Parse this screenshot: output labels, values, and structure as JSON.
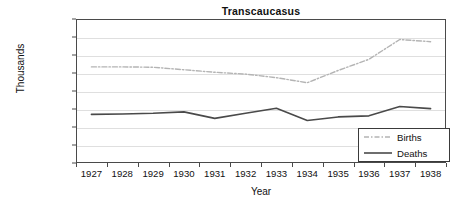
{
  "chart_data": {
    "type": "line",
    "title": "Transcaucasus",
    "xlabel": "Year",
    "ylabel": "Thousands",
    "categories": [
      "1927",
      "1928",
      "1929",
      "1930",
      "1931",
      "1932",
      "1933",
      "1934",
      "1935",
      "1936",
      "1937",
      "1938"
    ],
    "x": [
      1927,
      1928,
      1929,
      1930,
      1931,
      1932,
      1933,
      1934,
      1935,
      1936,
      1937,
      1938
    ],
    "series": [
      {
        "name": "Births",
        "values": [
          267,
          267,
          266,
          259,
          252,
          247,
          237,
          223,
          257,
          288,
          343,
          337
        ],
        "color": "#b4b4b4",
        "style": "dash-dot"
      },
      {
        "name": "Deaths",
        "values": [
          135,
          136,
          138,
          142,
          124,
          138,
          152,
          118,
          128,
          131,
          157,
          151
        ],
        "color": "#4a4a4a",
        "style": "solid"
      }
    ],
    "ylim": [
      0,
      400
    ],
    "yticks": [
      0,
      50,
      100,
      150,
      200,
      250,
      300,
      350,
      400
    ],
    "ytick_labels": [
      "0",
      "50",
      "100",
      "150",
      "200",
      "250",
      "300",
      "350",
      "400"
    ],
    "grid": true,
    "grid_axis": "y",
    "grid_color": "#dfdfdf",
    "legend_position": "lower-right",
    "axis_color": "#4a4a4a",
    "background": "#ffffff"
  },
  "legend": {
    "entries": [
      {
        "label": "Births"
      },
      {
        "label": "Deaths"
      }
    ]
  }
}
